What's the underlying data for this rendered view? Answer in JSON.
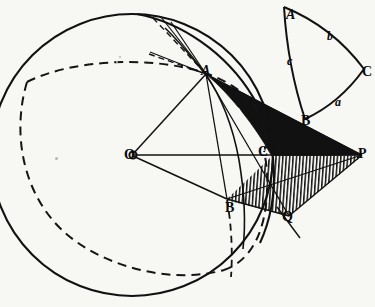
{
  "figure": {
    "background_color": "#f7f7f4",
    "ink_color": "#0d0d0d",
    "fill_black": "#111111"
  },
  "sphere": {
    "center_label": "O",
    "center": {
      "x": 132,
      "y": 155
    },
    "radius": 141,
    "outline_color": "#111111"
  },
  "main_points": [
    {
      "name": "O",
      "label": "O",
      "x": 132,
      "y": 155,
      "marker": "circle"
    },
    {
      "name": "A",
      "label": "A",
      "x": 206,
      "y": 73,
      "marker": "none"
    },
    {
      "name": "B",
      "label": "B",
      "x": 227,
      "y": 199,
      "marker": "none"
    },
    {
      "name": "C",
      "label": "C",
      "x": 272,
      "y": 155,
      "marker": "none"
    },
    {
      "name": "P",
      "label": "P",
      "x": 362,
      "y": 155,
      "marker": "none"
    },
    {
      "name": "Q",
      "label": "Q",
      "x": 288,
      "y": 217,
      "marker": "none"
    }
  ],
  "small_triangle": {
    "caption": "spherical triangle ABC",
    "vertices": [
      {
        "name": "A",
        "label": "A",
        "x": 288,
        "y": 14
      },
      {
        "name": "B",
        "label": "B",
        "x": 306,
        "y": 121
      },
      {
        "name": "C",
        "label": "C",
        "x": 365,
        "y": 72
      }
    ],
    "sides": [
      {
        "name": "a",
        "label": "a",
        "x": 338,
        "y": 103
      },
      {
        "name": "b",
        "label": "b",
        "x": 330,
        "y": 38
      },
      {
        "name": "c",
        "label": "c",
        "x": 291,
        "y": 62
      }
    ]
  },
  "regions": [
    {
      "name": "black-wedge",
      "fill": "solid-black",
      "description": "curved triangle A C P filled solid black"
    },
    {
      "name": "hatched-wedge",
      "fill": "vertical-hatch",
      "description": "quadrilateral C B Q P filled with vertical hatching"
    }
  ],
  "labels": {
    "O": "O",
    "A": "A",
    "B": "B",
    "C": "C",
    "P": "P",
    "Q": "Q",
    "a": "a",
    "b": "b",
    "c": "c",
    "tri_A": "A",
    "tri_B": "B",
    "tri_C": "C"
  }
}
